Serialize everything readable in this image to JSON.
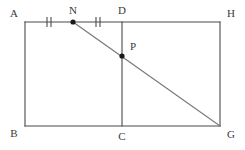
{
  "figure": {
    "background_color": "#ffffff",
    "stroke_color": "#4a4a4a",
    "diagonal_color": "#7a7a7a",
    "point_color": "#1a1a1a",
    "label_color": "#3a3a3a",
    "stroke_width": 1.1
  },
  "points": {
    "A": {
      "label": "A",
      "x": 25,
      "y": 22,
      "label_x": 14,
      "label_y": 14,
      "dot": false
    },
    "N": {
      "label": "N",
      "x": 73,
      "y": 22,
      "label_x": 73,
      "label_y": 11,
      "dot": true
    },
    "D": {
      "label": "D",
      "x": 122,
      "y": 22,
      "label_x": 122,
      "label_y": 11,
      "dot": false
    },
    "H": {
      "label": "H",
      "x": 220,
      "y": 22,
      "label_x": 231,
      "label_y": 14,
      "dot": false
    },
    "P": {
      "label": "P",
      "x": 122,
      "y": 56,
      "label_x": 133,
      "label_y": 47,
      "dot": true
    },
    "B": {
      "label": "B",
      "x": 25,
      "y": 126,
      "label_x": 14,
      "label_y": 134,
      "dot": false
    },
    "C": {
      "label": "C",
      "x": 122,
      "y": 126,
      "label_x": 122,
      "label_y": 137,
      "dot": false
    },
    "G": {
      "label": "G",
      "x": 220,
      "y": 126,
      "label_x": 231,
      "label_y": 135,
      "dot": false
    }
  },
  "segments": [
    {
      "name": "side-AH-top",
      "from": "A",
      "to": "H",
      "style": "solid"
    },
    {
      "name": "side-AB-left",
      "from": "A",
      "to": "B",
      "style": "solid"
    },
    {
      "name": "side-BG-bottom",
      "from": "B",
      "to": "G",
      "style": "solid"
    },
    {
      "name": "side-HG-right",
      "from": "H",
      "to": "G",
      "style": "solid"
    },
    {
      "name": "segment-DC-vertical",
      "from": "D",
      "to": "C",
      "style": "solid"
    },
    {
      "name": "segment-NG-diagonal",
      "from": "N",
      "to": "G",
      "style": "diagonal"
    }
  ],
  "tick_marks": [
    {
      "name": "tick-AN",
      "on_segment": "A-N",
      "center_x": 49,
      "center_y": 22,
      "count": 2,
      "spacing": 4,
      "half_height": 5
    },
    {
      "name": "tick-ND",
      "on_segment": "N-D",
      "center_x": 98,
      "center_y": 22,
      "count": 2,
      "spacing": 4,
      "half_height": 5
    }
  ],
  "annotations": {
    "equal_marks_meaning": "AN = ND",
    "dot_radius": 2.6
  }
}
